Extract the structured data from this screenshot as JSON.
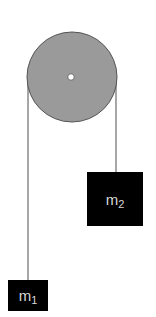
{
  "diagram": {
    "type": "atwood-machine",
    "pulley": {
      "fill": "#9a9a9a",
      "stroke": "#555555",
      "hub_fill": "#ffffff"
    },
    "rope_color": "#777777",
    "masses": [
      {
        "id": "m1",
        "label": "m",
        "subscript": "1"
      },
      {
        "id": "m2",
        "label": "m",
        "subscript": "2"
      }
    ]
  }
}
